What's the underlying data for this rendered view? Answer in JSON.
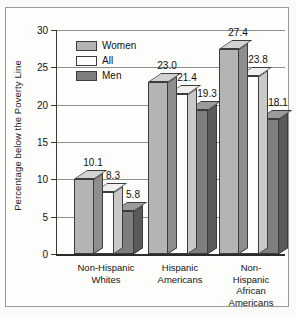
{
  "chart_data": {
    "type": "bar",
    "title": "",
    "subtitle": "",
    "xlabel": "",
    "ylabel": "Percentage below the Poverty Line",
    "ylim": [
      0,
      30
    ],
    "yticks": [
      0,
      5,
      10,
      15,
      20,
      25,
      30
    ],
    "ytick_labels": [
      "0",
      "5",
      "10",
      "15",
      "20",
      "25",
      "30"
    ],
    "grid": true,
    "grid_axis": "y",
    "legend_position": "upper-left-inside",
    "style": "3d-grouped-bars",
    "categories": [
      "Non-Hispanic\nWhites",
      "Hispanic\nAmericans",
      "Non-Hispanic\nAfrican\nAmericans"
    ],
    "series": [
      {
        "name": "Women",
        "color": "#b4b4b4",
        "values": [
          10.1,
          23.0,
          27.4
        ]
      },
      {
        "name": "All",
        "color": "#ffffff",
        "values": [
          8.3,
          21.4,
          23.8
        ]
      },
      {
        "name": "Men",
        "color": "#7e7e7e",
        "values": [
          5.8,
          19.3,
          18.1
        ]
      }
    ],
    "value_labels": [
      [
        "10.1",
        "8.3",
        "5.8"
      ],
      [
        "23.0",
        "21.4",
        "19.3"
      ],
      [
        "27.4",
        "23.8",
        "18.1"
      ]
    ]
  },
  "legend": {
    "items": [
      {
        "label": "Women",
        "swatch": "#b4b4b4"
      },
      {
        "label": "All",
        "swatch": "#ffffff"
      },
      {
        "label": "Men",
        "swatch": "#7e7e7e"
      }
    ]
  },
  "colors": {
    "axis": "#2b2b2b",
    "gridline": "#8e8e8e",
    "text": "#141414",
    "frame": "#9a9a9a",
    "background": "#fdfdfc"
  }
}
